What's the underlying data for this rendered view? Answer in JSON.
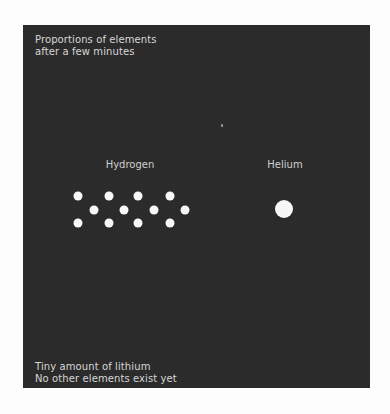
{
  "diagram": {
    "background": "#fdfdfd",
    "panel_color": "#2b2b2b",
    "dot_color": "#f7f7f7",
    "title": {
      "line1": "Proportions of elements",
      "line2": "after a few minutes"
    },
    "footer": {
      "line1": "Tiny amount of lithium",
      "line2": "No other elements exist yet"
    },
    "groups": [
      {
        "label": "Hydrogen",
        "dot_count": 12,
        "dot_diameter": 9
      },
      {
        "label": "Helium",
        "dot_count": 1,
        "dot_diameter": 18
      }
    ],
    "lithium_marker": "tiny speck"
  }
}
